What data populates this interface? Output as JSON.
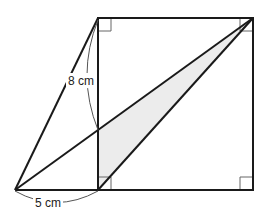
{
  "diagram": {
    "type": "geometry",
    "colors": {
      "stroke": "#1a1a1a",
      "shade": "#ececec",
      "dimension_line": "#555555",
      "right_angle_mark": "#666666",
      "background": "#ffffff"
    },
    "points": {
      "A_apex": [
        15,
        190
      ],
      "B_square_bottom_left": [
        98,
        190
      ],
      "C_square_bottom_right": [
        253,
        190
      ],
      "D_square_top_right": [
        253,
        18
      ],
      "E_square_top_left": [
        98,
        18
      ],
      "F_intersection": [
        98,
        130
      ]
    },
    "labels": {
      "height": "8 cm",
      "base": "5 cm"
    },
    "right_angle_marks": [
      "top-left",
      "top-right",
      "bottom-left-inner",
      "bottom-right"
    ],
    "shaded_region": [
      "F_intersection",
      "D_square_top_right",
      "B_square_bottom_left"
    ]
  }
}
